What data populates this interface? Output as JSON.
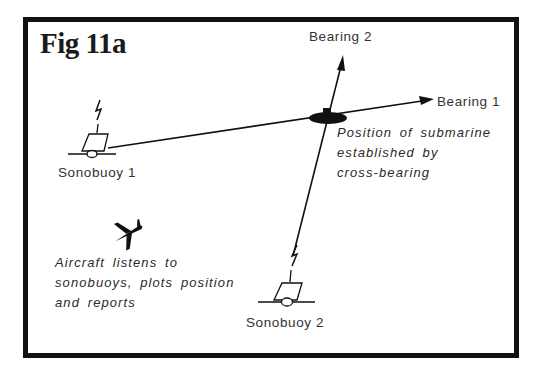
{
  "figure": {
    "title": "Fig 11a",
    "colors": {
      "ink": "#111111",
      "text": "#333333",
      "background": "#ffffff"
    }
  },
  "labels": {
    "bearing_1": "Bearing 1",
    "bearing_2": "Bearing 2",
    "sonobuoy_1": "Sonobuoy 1",
    "sonobuoy_2": "Sonobuoy 2"
  },
  "notes": {
    "submarine": [
      "Position of submarine",
      "established by",
      "cross-bearing"
    ],
    "aircraft": [
      "Aircraft listens to",
      "sonobuoys, plots position",
      "and reports"
    ]
  },
  "icons": {
    "sonobuoy": "sonobuoy-icon",
    "radio_signal": "lightning-icon",
    "aircraft": "airplane-icon",
    "submarine": "submarine-position-icon",
    "arrow": "arrowhead-icon"
  }
}
